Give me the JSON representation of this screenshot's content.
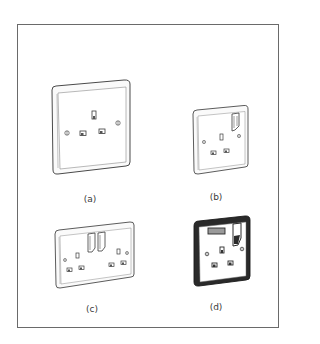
{
  "figure": {
    "frame_color": "#6a6a6a",
    "line_color": "#4a4a4a",
    "panels": [
      {
        "id": "a",
        "label": "(a)",
        "description": "Single unswitched socket outlet"
      },
      {
        "id": "b",
        "label": "(b)",
        "description": "Single switched socket outlet"
      },
      {
        "id": "c",
        "label": "(c)",
        "description": "Double switched socket outlet"
      },
      {
        "id": "d",
        "label": "(d)",
        "description": "Single switched socket with neon indicator, dark finish"
      }
    ]
  }
}
